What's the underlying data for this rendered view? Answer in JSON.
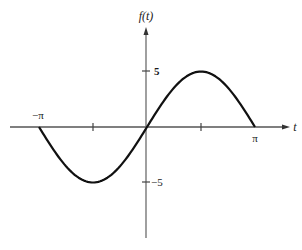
{
  "chart_data": {
    "type": "line",
    "title": "",
    "xlabel": "t",
    "ylabel": "f(t)",
    "function": "f(t) = 5 sin(t)",
    "x_domain": [
      -3.14159,
      3.14159
    ],
    "xlim": [
      -4.0,
      4.5
    ],
    "ylim": [
      -10,
      9
    ],
    "x_tick_labels": [
      {
        "value": -3.14159,
        "label": "−π"
      },
      {
        "value": -1.5708,
        "label": ""
      },
      {
        "value": 1.5708,
        "label": ""
      },
      {
        "value": 3.14159,
        "label": "π"
      }
    ],
    "y_tick_labels": [
      {
        "value": 5,
        "label": "5"
      },
      {
        "value": -5,
        "label": "−5"
      }
    ],
    "series": [
      {
        "name": "f(t)",
        "x": [
          -3.14159,
          -2.35619,
          -1.5708,
          -0.7854,
          0,
          0.7854,
          1.5708,
          2.35619,
          3.14159
        ],
        "y": [
          0,
          -3.54,
          -5,
          -3.54,
          0,
          3.54,
          5,
          3.54,
          0
        ]
      }
    ],
    "grid": false,
    "legend": null
  },
  "axes": {
    "y_label": "f(t)",
    "x_label": "t",
    "tick_neg_pi": "−π",
    "tick_pi": "π",
    "tick_5": "5",
    "tick_neg5": "−5"
  },
  "colors": {
    "axis": "#555555",
    "curve": "#111111",
    "text": "#1a1a1a"
  }
}
